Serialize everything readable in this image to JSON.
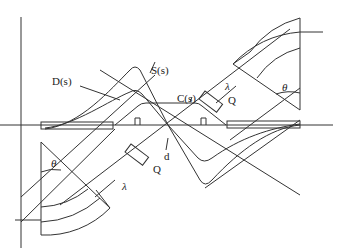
{
  "diagram": {
    "labels": {
      "D": "D(s)",
      "S": "S(s)",
      "C": "C(s)",
      "Q_upper": "Q",
      "Q_lower": "Q",
      "lambda_upper": "λ",
      "lambda_lower": "λ",
      "theta_upper": "θ",
      "theta_lower": "θ",
      "d": "d"
    },
    "colors": {
      "line": "#333333",
      "background": "#ffffff"
    }
  }
}
